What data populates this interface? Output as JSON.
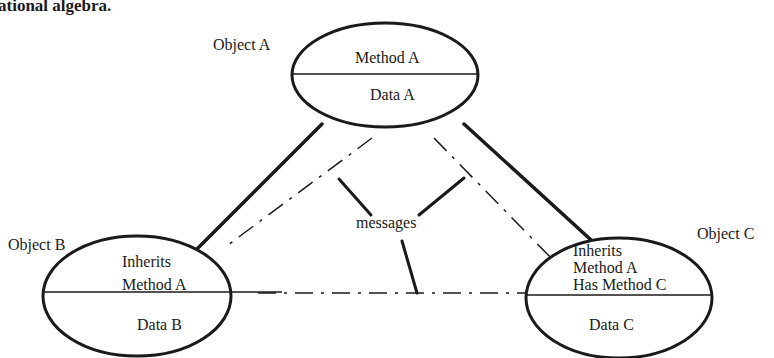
{
  "header_fragment": "ational algebra.",
  "objects": {
    "a": {
      "label": "Object A",
      "method_lines": [
        "Method A"
      ],
      "data": "Data A"
    },
    "b": {
      "label": "Object B",
      "method_lines": [
        "Inherits",
        "Method A"
      ],
      "data": "Data B"
    },
    "c": {
      "label": "Object C",
      "method_lines": [
        "Inherits",
        "Method A",
        "Has Method C"
      ],
      "data": "Data C"
    }
  },
  "messages_label": "messages",
  "colors": {
    "ink": "#1a1a1a",
    "background": "#ffffff"
  }
}
